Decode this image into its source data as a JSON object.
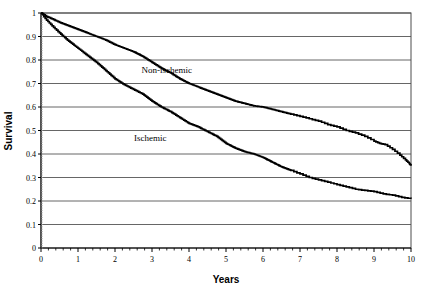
{
  "figure": {
    "background": "#ffffff",
    "ink_color": "#000000",
    "grid_color": "#666666"
  },
  "axes": {
    "y_title": "Survival",
    "x_title": "Years",
    "y_ticks": [
      "0",
      "0.1",
      "0.2",
      "0.3",
      "0.4",
      "0.5",
      "0.6",
      "0.7",
      "0.8",
      "0.9",
      "1"
    ],
    "x_ticks": [
      "0",
      "1",
      "2",
      "3",
      "4",
      "5",
      "6",
      "7",
      "8",
      "9",
      "10"
    ]
  },
  "annotations": {
    "non_ischemic_label": "Non-ischemic",
    "ischemic_label": "Ischemic"
  },
  "chart_data": {
    "type": "line",
    "title": "",
    "xlabel": "Years",
    "ylabel": "Survival",
    "xlim": [
      0,
      10
    ],
    "ylim": [
      0,
      1
    ],
    "grid": true,
    "legend_position": "inline-annotation",
    "x_tick_values": [
      0,
      1,
      2,
      3,
      4,
      5,
      6,
      7,
      8,
      9,
      10
    ],
    "y_tick_values": [
      0,
      0.1,
      0.2,
      0.3,
      0.4,
      0.5,
      0.6,
      0.7,
      0.8,
      0.9,
      1
    ],
    "minor_x_ticks_per_interval": 4,
    "series": [
      {
        "name": "Non-ischemic",
        "color": "#000000",
        "x": [
          0,
          0.15,
          0.3,
          0.5,
          0.75,
          1.0,
          1.25,
          1.5,
          1.75,
          2.0,
          2.25,
          2.5,
          2.75,
          3.0,
          3.25,
          3.5,
          3.75,
          4.0,
          4.25,
          4.5,
          4.75,
          5.0,
          5.25,
          5.5,
          5.75,
          6.0,
          6.25,
          6.5,
          6.75,
          7.0,
          7.25,
          7.5,
          7.75,
          8.0,
          8.25,
          8.5,
          8.75,
          9.0,
          9.15,
          9.3,
          9.5,
          9.7,
          9.85,
          9.95,
          10.0
        ],
        "values": [
          1.0,
          0.985,
          0.975,
          0.96,
          0.945,
          0.93,
          0.915,
          0.9,
          0.885,
          0.865,
          0.85,
          0.835,
          0.815,
          0.79,
          0.765,
          0.745,
          0.72,
          0.7,
          0.685,
          0.67,
          0.655,
          0.64,
          0.625,
          0.615,
          0.605,
          0.6,
          0.59,
          0.58,
          0.57,
          0.56,
          0.55,
          0.54,
          0.525,
          0.515,
          0.5,
          0.49,
          0.475,
          0.455,
          0.445,
          0.44,
          0.42,
          0.395,
          0.375,
          0.36,
          0.35
        ]
      },
      {
        "name": "Ischemic",
        "color": "#000000",
        "x": [
          0,
          0.15,
          0.3,
          0.5,
          0.75,
          1.0,
          1.25,
          1.5,
          1.75,
          2.0,
          2.25,
          2.5,
          2.75,
          3.0,
          3.25,
          3.5,
          3.75,
          4.0,
          4.25,
          4.5,
          4.75,
          5.0,
          5.25,
          5.5,
          5.75,
          6.0,
          6.25,
          6.5,
          6.75,
          7.0,
          7.25,
          7.5,
          7.75,
          8.0,
          8.25,
          8.5,
          8.75,
          9.0,
          9.25,
          9.5,
          9.75,
          10.0
        ],
        "values": [
          1.0,
          0.97,
          0.945,
          0.915,
          0.88,
          0.85,
          0.82,
          0.79,
          0.755,
          0.72,
          0.695,
          0.675,
          0.655,
          0.625,
          0.6,
          0.58,
          0.555,
          0.53,
          0.515,
          0.495,
          0.475,
          0.445,
          0.425,
          0.41,
          0.4,
          0.385,
          0.365,
          0.345,
          0.33,
          0.315,
          0.3,
          0.29,
          0.28,
          0.27,
          0.26,
          0.25,
          0.245,
          0.24,
          0.23,
          0.225,
          0.215,
          0.21
        ]
      }
    ],
    "annotations": [
      {
        "text": "Non-ischemic",
        "x": 3.4,
        "y": 0.745
      },
      {
        "text": "Ischemic",
        "x": 2.95,
        "y": 0.455
      }
    ]
  }
}
